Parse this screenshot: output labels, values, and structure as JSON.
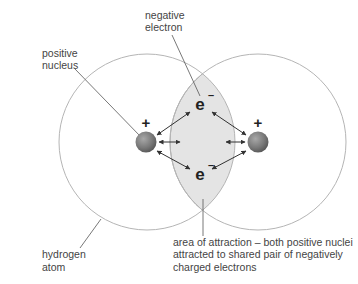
{
  "diagram": {
    "labels": {
      "negative_electron": [
        "negative",
        "electron"
      ],
      "positive_nucleus": [
        "positive",
        "nucleus"
      ],
      "hydrogen_atom": [
        "hydrogen",
        "atom"
      ],
      "area_of_attraction": [
        "area of attraction – both positive nuclei",
        "attracted to shared pair of negatively",
        "charged electrons"
      ]
    },
    "symbols": {
      "plus": "+",
      "electron": "e",
      "electron_charge": "–"
    },
    "atoms": [
      {
        "name": "hydrogen atom left",
        "charge": "+"
      },
      {
        "name": "hydrogen atom right",
        "charge": "+"
      }
    ],
    "electrons": [
      {
        "name": "shared electron top",
        "symbol": "e–"
      },
      {
        "name": "shared electron bottom",
        "symbol": "e–"
      }
    ],
    "colors": {
      "shell_stroke": "#b5b5b5",
      "overlap_fill": "#e4e4e4",
      "nucleus_fill": "#7a7a7a",
      "arrow": "#333333",
      "text": "#444444"
    }
  }
}
